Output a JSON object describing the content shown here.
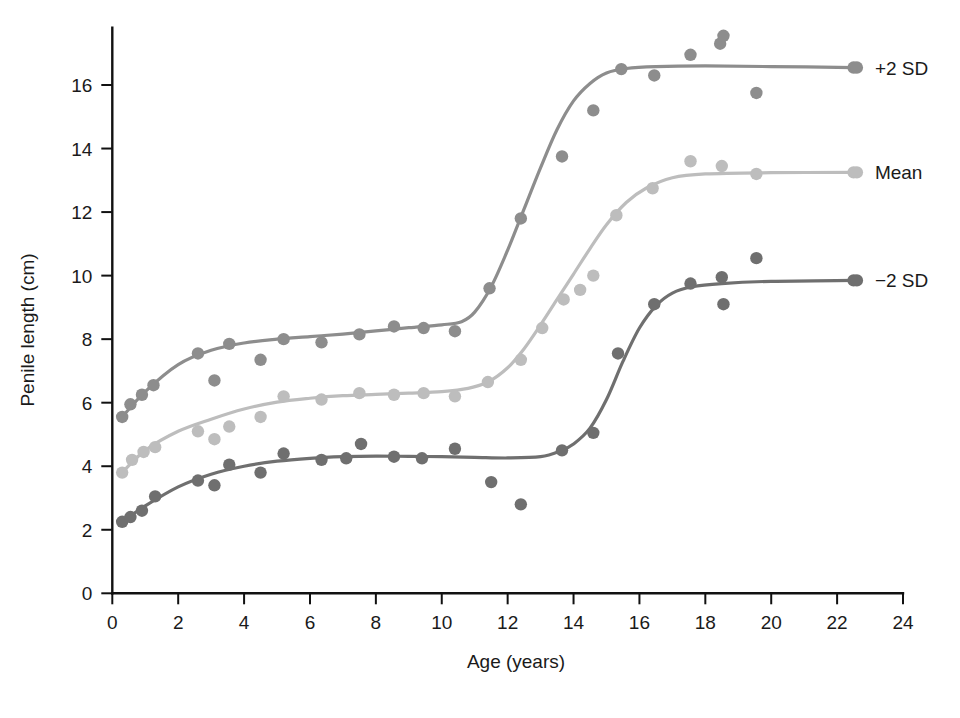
{
  "chart_data": {
    "type": "scatter",
    "title": "",
    "xlabel": "Age (years)",
    "ylabel": "Penile length (cm)",
    "xlim": [
      0,
      24
    ],
    "ylim": [
      0,
      17.8
    ],
    "xticks": [
      0,
      2,
      4,
      6,
      8,
      10,
      12,
      14,
      16,
      18,
      20,
      22,
      24
    ],
    "yticks": [
      0,
      2,
      4,
      6,
      8,
      10,
      12,
      14,
      16
    ],
    "xtick_labels": [
      "0",
      "2",
      "4",
      "6",
      "8",
      "10",
      "12",
      "14",
      "16",
      "18",
      "20",
      "22",
      "24"
    ],
    "ytick_labels": [
      "0",
      "2",
      "4",
      "6",
      "8",
      "10",
      "12",
      "14",
      "16"
    ],
    "grid": false,
    "legend_position": "right-of-curves",
    "series": [
      {
        "name": "+2 SD",
        "label": "+2 SD",
        "color": "#8d8d8d",
        "label_x": 22.6,
        "label_y": 16.55,
        "points": [
          [
            0.3,
            5.55
          ],
          [
            0.55,
            5.95
          ],
          [
            0.9,
            6.25
          ],
          [
            1.25,
            6.55
          ],
          [
            2.6,
            7.55
          ],
          [
            3.1,
            6.7
          ],
          [
            3.55,
            7.85
          ],
          [
            4.5,
            7.35
          ],
          [
            5.2,
            8.0
          ],
          [
            6.35,
            7.9
          ],
          [
            7.5,
            8.15
          ],
          [
            8.55,
            8.4
          ],
          [
            9.45,
            8.35
          ],
          [
            10.4,
            8.25
          ],
          [
            11.45,
            9.6
          ],
          [
            12.4,
            11.8
          ],
          [
            13.65,
            13.75
          ],
          [
            14.6,
            15.2
          ],
          [
            15.45,
            16.5
          ],
          [
            16.45,
            16.3
          ],
          [
            17.55,
            16.95
          ],
          [
            18.45,
            17.3
          ],
          [
            18.55,
            17.55
          ],
          [
            19.55,
            15.75
          ],
          [
            22.5,
            16.55
          ]
        ],
        "curve": [
          [
            0.3,
            5.55
          ],
          [
            1.0,
            6.35
          ],
          [
            2.0,
            7.2
          ],
          [
            3.0,
            7.65
          ],
          [
            4.0,
            7.88
          ],
          [
            5.0,
            8.0
          ],
          [
            6.0,
            8.08
          ],
          [
            7.0,
            8.16
          ],
          [
            8.0,
            8.26
          ],
          [
            9.0,
            8.36
          ],
          [
            10.0,
            8.45
          ],
          [
            10.6,
            8.55
          ],
          [
            11.0,
            8.85
          ],
          [
            11.5,
            9.65
          ],
          [
            12.0,
            10.8
          ],
          [
            12.5,
            12.1
          ],
          [
            13.0,
            13.4
          ],
          [
            13.5,
            14.6
          ],
          [
            14.0,
            15.5
          ],
          [
            14.5,
            16.05
          ],
          [
            15.0,
            16.38
          ],
          [
            15.6,
            16.52
          ],
          [
            16.5,
            16.58
          ],
          [
            18.0,
            16.6
          ],
          [
            20.0,
            16.58
          ],
          [
            22.5,
            16.55
          ]
        ]
      },
      {
        "name": "Mean",
        "label": "Mean",
        "color": "#bdbdbd",
        "label_x": 22.6,
        "label_y": 13.25,
        "points": [
          [
            0.3,
            3.8
          ],
          [
            0.6,
            4.2
          ],
          [
            0.95,
            4.45
          ],
          [
            1.3,
            4.6
          ],
          [
            2.6,
            5.1
          ],
          [
            3.1,
            4.85
          ],
          [
            3.55,
            5.25
          ],
          [
            4.5,
            5.55
          ],
          [
            5.2,
            6.2
          ],
          [
            6.35,
            6.1
          ],
          [
            7.5,
            6.3
          ],
          [
            8.55,
            6.25
          ],
          [
            9.45,
            6.3
          ],
          [
            10.4,
            6.2
          ],
          [
            11.4,
            6.65
          ],
          [
            12.4,
            7.35
          ],
          [
            13.05,
            8.35
          ],
          [
            13.7,
            9.25
          ],
          [
            14.2,
            9.55
          ],
          [
            14.6,
            10.0
          ],
          [
            15.3,
            11.9
          ],
          [
            16.4,
            12.75
          ],
          [
            17.55,
            13.6
          ],
          [
            18.5,
            13.45
          ],
          [
            19.55,
            13.2
          ],
          [
            22.5,
            13.25
          ]
        ],
        "curve": [
          [
            0.3,
            3.8
          ],
          [
            1.0,
            4.5
          ],
          [
            2.0,
            5.1
          ],
          [
            3.0,
            5.48
          ],
          [
            4.0,
            5.8
          ],
          [
            5.0,
            6.02
          ],
          [
            6.0,
            6.14
          ],
          [
            7.0,
            6.22
          ],
          [
            8.0,
            6.26
          ],
          [
            9.0,
            6.3
          ],
          [
            10.0,
            6.35
          ],
          [
            10.8,
            6.45
          ],
          [
            11.4,
            6.65
          ],
          [
            12.0,
            7.1
          ],
          [
            12.5,
            7.7
          ],
          [
            13.0,
            8.45
          ],
          [
            13.5,
            9.25
          ],
          [
            14.0,
            10.05
          ],
          [
            14.5,
            10.85
          ],
          [
            15.0,
            11.6
          ],
          [
            15.6,
            12.3
          ],
          [
            16.2,
            12.75
          ],
          [
            17.0,
            13.08
          ],
          [
            18.0,
            13.2
          ],
          [
            20.0,
            13.24
          ],
          [
            22.5,
            13.25
          ]
        ]
      },
      {
        "name": "-2 SD",
        "label": "−2 SD",
        "color": "#6f6f6f",
        "label_x": 22.6,
        "label_y": 9.85,
        "points": [
          [
            0.3,
            2.25
          ],
          [
            0.55,
            2.4
          ],
          [
            0.9,
            2.6
          ],
          [
            1.3,
            3.05
          ],
          [
            2.6,
            3.55
          ],
          [
            3.1,
            3.4
          ],
          [
            3.55,
            4.05
          ],
          [
            4.5,
            3.8
          ],
          [
            5.2,
            4.4
          ],
          [
            6.35,
            4.2
          ],
          [
            7.1,
            4.25
          ],
          [
            7.55,
            4.7
          ],
          [
            8.55,
            4.3
          ],
          [
            9.4,
            4.25
          ],
          [
            10.4,
            4.55
          ],
          [
            11.5,
            3.5
          ],
          [
            12.4,
            2.8
          ],
          [
            13.65,
            4.5
          ],
          [
            14.6,
            5.05
          ],
          [
            15.35,
            7.55
          ],
          [
            16.45,
            9.1
          ],
          [
            17.55,
            9.75
          ],
          [
            18.5,
            9.95
          ],
          [
            18.55,
            9.1
          ],
          [
            19.55,
            10.55
          ],
          [
            22.5,
            9.85
          ]
        ],
        "curve": [
          [
            0.3,
            2.25
          ],
          [
            1.0,
            2.75
          ],
          [
            2.0,
            3.35
          ],
          [
            3.0,
            3.75
          ],
          [
            4.0,
            4.0
          ],
          [
            5.0,
            4.16
          ],
          [
            6.0,
            4.25
          ],
          [
            7.0,
            4.3
          ],
          [
            8.0,
            4.32
          ],
          [
            9.0,
            4.31
          ],
          [
            10.0,
            4.3
          ],
          [
            11.0,
            4.28
          ],
          [
            12.0,
            4.26
          ],
          [
            13.0,
            4.3
          ],
          [
            13.6,
            4.48
          ],
          [
            14.0,
            4.7
          ],
          [
            14.5,
            5.2
          ],
          [
            15.0,
            6.1
          ],
          [
            15.5,
            7.3
          ],
          [
            16.0,
            8.35
          ],
          [
            16.5,
            9.05
          ],
          [
            17.0,
            9.45
          ],
          [
            17.6,
            9.65
          ],
          [
            18.5,
            9.75
          ],
          [
            20.0,
            9.82
          ],
          [
            22.5,
            9.85
          ]
        ]
      }
    ]
  }
}
